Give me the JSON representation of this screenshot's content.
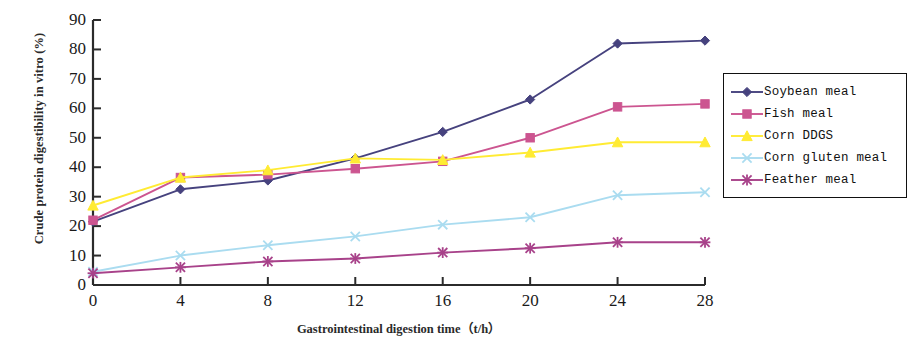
{
  "chart_data": {
    "type": "line",
    "title": "",
    "xlabel": "Gastrointestinal digestion time（t/h）",
    "ylabel": "Crude protein digestibility in vitro (%)",
    "x": [
      0,
      4,
      8,
      12,
      16,
      20,
      24,
      28
    ],
    "xticklabels": [
      "0",
      "4",
      "8",
      "12",
      "16",
      "20",
      "24",
      "28"
    ],
    "yticklabels": [
      "0",
      "10",
      "20",
      "30",
      "40",
      "50",
      "60",
      "70",
      "80",
      "90"
    ],
    "xlim": [
      0,
      28
    ],
    "ylim": [
      0,
      90
    ],
    "grid": false,
    "legend_position": "right",
    "series": [
      {
        "name": "Soybean meal",
        "color": "#46427e",
        "marker": "diamond",
        "values": [
          21.5,
          32.5,
          35.5,
          43.0,
          52.0,
          63.0,
          82.0,
          83.0
        ]
      },
      {
        "name": "Fish meal",
        "color": "#cc5590",
        "marker": "square",
        "values": [
          22.0,
          36.5,
          37.5,
          39.5,
          42.0,
          50.0,
          60.5,
          61.5
        ]
      },
      {
        "name": "Corn DDGS",
        "color": "#ffeb33",
        "marker": "triangle",
        "values": [
          27.0,
          36.5,
          39.0,
          43.0,
          42.5,
          45.0,
          48.5,
          48.5
        ]
      },
      {
        "name": "Corn gluten meal",
        "color": "#aadcf0",
        "marker": "x",
        "values": [
          4.5,
          10.0,
          13.5,
          16.5,
          20.5,
          23.0,
          30.5,
          31.5
        ]
      },
      {
        "name": "Feather meal",
        "color": "#a8428a",
        "marker": "asterisk",
        "values": [
          4.0,
          6.0,
          8.0,
          9.0,
          11.0,
          12.5,
          14.5,
          14.5
        ]
      }
    ]
  },
  "axis": {
    "color": "#2b2b2b"
  }
}
